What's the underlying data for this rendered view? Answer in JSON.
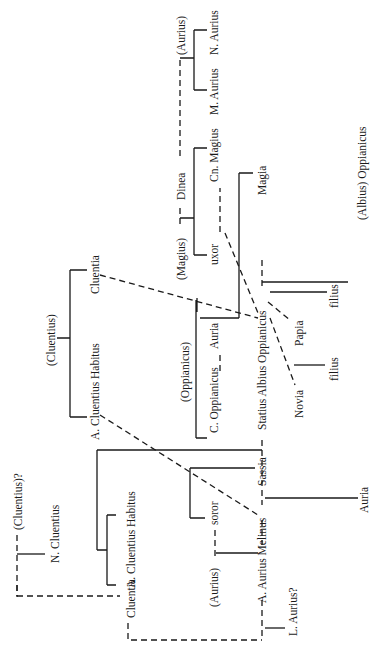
{
  "diagram": {
    "type": "family-tree",
    "orientation": "rotated-90-ccw",
    "legend": {
      "solid_line": "descent",
      "dashed_line": "marriage"
    },
    "people": {
      "aurius_top": "(Aurius)",
      "n_aurius": "N. Aurius",
      "m_aurius": "M. Aurius",
      "dinea": "Dinea",
      "magius": "(Magius)",
      "cn_magius": "Cn. Magius",
      "uxor": "uxor",
      "magia": "Magia",
      "albius_oppianicus": "(Albius) Oppianicus",
      "cluentius_parent": "(Cluentius)",
      "cluentia_top": "Cluentia",
      "a_cluentius_habitus_top": "A. Cluentius Habitus",
      "oppianicus_parent": "(Oppianicus)",
      "c_oppianicus": "C. Oppianicus",
      "auria_mid": "Auria",
      "statius_albius_oppianicus": "Statius Albius Oppianicus",
      "filius_1": "filius",
      "papia": "Papia",
      "novia": "Novia",
      "filius_2": "filius",
      "cluentius_q": "(Cluentius)?",
      "n_cluentius": "N. Cluentius",
      "a_cluentius_habitus_bottom": "A. Cluentius Habitus",
      "cluentia_bottom": "Cluentia",
      "sassia": "Sassia",
      "soror": "soror",
      "aurius_mid": "(Aurius)",
      "a_aurius_melinus": "A. Aurius Melinus",
      "l_aurius": "L. Aurius?",
      "auria_bottom": "Auria"
    }
  }
}
